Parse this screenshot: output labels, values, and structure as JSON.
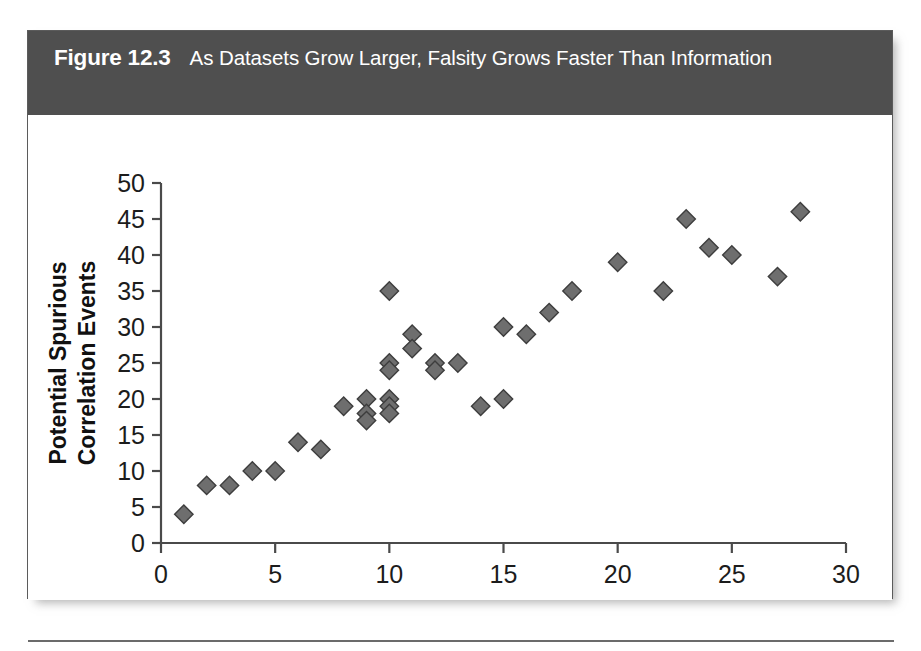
{
  "figure": {
    "number": "Figure 12.3",
    "caption": "As Datasets Grow Larger, Falsity Grows Faster Than Information"
  },
  "colors": {
    "header_background": "#4f4f4f",
    "header_text": "#ffffff",
    "marker_fill": "#6e6e6e",
    "marker_stroke": "#3d3d3d",
    "axis": "#4a4a4a",
    "card_border": "#5b5b5b",
    "page_background": "#ffffff"
  },
  "chart_data": {
    "type": "scatter",
    "title": "As Datasets Grow Larger, Falsity Grows Faster Than Information",
    "xlabel": "Number of Variables",
    "ylabel": "Potential Spurious Correlation Events",
    "ylabel_lines": [
      "Potential Spurious",
      "Correlation Events"
    ],
    "xlim": [
      0,
      30
    ],
    "ylim": [
      0,
      50
    ],
    "xticks": [
      0,
      5,
      10,
      15,
      20,
      25,
      30
    ],
    "yticks": [
      0,
      5,
      10,
      15,
      20,
      25,
      30,
      35,
      40,
      45,
      50
    ],
    "xtick_labels": [
      "0",
      "5",
      "10",
      "15",
      "20",
      "25",
      "30"
    ],
    "ytick_labels": [
      "0",
      "5",
      "10",
      "15",
      "20",
      "25",
      "30",
      "35",
      "40",
      "45",
      "50"
    ],
    "grid": false,
    "legend": null,
    "marker": "diamond",
    "series": [
      {
        "name": "Potential Spurious Correlation Events",
        "x": [
          1,
          2,
          3,
          4,
          5,
          6,
          7,
          8,
          9,
          9,
          9,
          10,
          10,
          10,
          10,
          10,
          10,
          11,
          11,
          12,
          12,
          13,
          14,
          15,
          15,
          16,
          17,
          18,
          20,
          22,
          23,
          24,
          25,
          27,
          28
        ],
        "y": [
          4,
          8,
          8,
          10,
          10,
          14,
          13,
          19,
          20,
          18,
          17,
          35,
          25,
          24,
          20,
          19,
          18,
          29,
          27,
          25,
          24,
          25,
          19,
          20,
          30,
          29,
          32,
          35,
          39,
          35,
          45,
          41,
          40,
          37,
          46
        ]
      }
    ],
    "points": [
      {
        "x": 1,
        "y": 4
      },
      {
        "x": 2,
        "y": 8
      },
      {
        "x": 3,
        "y": 8
      },
      {
        "x": 4,
        "y": 10
      },
      {
        "x": 5,
        "y": 10
      },
      {
        "x": 6,
        "y": 14
      },
      {
        "x": 7,
        "y": 13
      },
      {
        "x": 8,
        "y": 19
      },
      {
        "x": 9,
        "y": 20
      },
      {
        "x": 9,
        "y": 18
      },
      {
        "x": 9,
        "y": 17
      },
      {
        "x": 10,
        "y": 35
      },
      {
        "x": 10,
        "y": 25
      },
      {
        "x": 10,
        "y": 24
      },
      {
        "x": 10,
        "y": 20
      },
      {
        "x": 10,
        "y": 19
      },
      {
        "x": 10,
        "y": 18
      },
      {
        "x": 11,
        "y": 29
      },
      {
        "x": 11,
        "y": 27
      },
      {
        "x": 12,
        "y": 25
      },
      {
        "x": 12,
        "y": 24
      },
      {
        "x": 13,
        "y": 25
      },
      {
        "x": 14,
        "y": 19
      },
      {
        "x": 15,
        "y": 20
      },
      {
        "x": 15,
        "y": 30
      },
      {
        "x": 16,
        "y": 29
      },
      {
        "x": 17,
        "y": 32
      },
      {
        "x": 18,
        "y": 35
      },
      {
        "x": 20,
        "y": 39
      },
      {
        "x": 22,
        "y": 35
      },
      {
        "x": 23,
        "y": 45
      },
      {
        "x": 24,
        "y": 41
      },
      {
        "x": 25,
        "y": 40
      },
      {
        "x": 27,
        "y": 37
      },
      {
        "x": 28,
        "y": 46
      }
    ]
  }
}
